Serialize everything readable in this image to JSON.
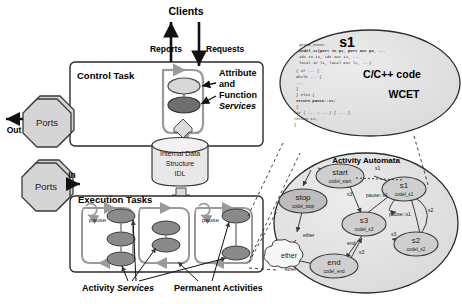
{
  "figure": {
    "colors": {
      "attribute_service": "#d2d2d2",
      "function_service": "#6f6f6f",
      "activity_service": "#8a8a8a",
      "box_stroke": "#2b2b2b",
      "ports_fill": "#d5d5d5",
      "cylinder_fill": "#e8e8e8",
      "ellipse_fill": "#e0e0e0",
      "node_fill": "#cfcfcf",
      "ether_fill": "#f5f5f5",
      "flow_arrow": "#9a9a9a"
    }
  },
  "left": {
    "clients_label": "Clients",
    "reports_label": "Reports",
    "requests_label": "Requests",
    "control_task_label": "Control Task",
    "execution_tasks_label": "Execution Tasks",
    "attribute_and_function_services": [
      "Attribute",
      "and",
      "Function",
      "Services"
    ],
    "idl_store": [
      "Internal Data",
      "Structure",
      "IDL"
    ],
    "ports": [
      {
        "name": "Ports",
        "direction": "Out"
      },
      {
        "name": "Ports",
        "direction": "In"
      }
    ],
    "pause_labels": [
      "pause",
      "pause",
      "pause"
    ],
    "bottom_labels": [
      {
        "text": "Activity ",
        "emph": "Services"
      },
      {
        "text": "Permanent Activities",
        "emph": ""
      }
    ]
  },
  "codel_ellipse": {
    "state_name": "s1",
    "lang_label": "C/C++ code",
    "wcet_label": "WCET",
    "code_lines": [
      "genom_event",
      "codel_s1(port in p1, port out p2, ...",
      "        ids in i1, ids out i2, ...",
      "        local in l1, local out l2, ...)",
      "{ if ... {",
      "      while ... {",
      "        ...",
      "      }",
      "  } else {",
      "      return pause::s1;",
      "  }",
      "  for ( ... ; ...) { ... }",
      "  return s2;",
      "}"
    ]
  },
  "automata": {
    "title": "Activity Automata",
    "nodes": [
      {
        "id": "start",
        "name": "start",
        "codel": "codel_start"
      },
      {
        "id": "stop",
        "name": "stop",
        "codel": "codel_stop"
      },
      {
        "id": "s1",
        "name": "s1",
        "codel": "codel_s1"
      },
      {
        "id": "s3",
        "name": "s3",
        "codel": "codel_s3"
      },
      {
        "id": "s2",
        "name": "s2",
        "codel": "codel_s2"
      },
      {
        "id": "end",
        "name": "end",
        "codel": "codel_end"
      }
    ],
    "ether_node": "ether",
    "edge_labels": [
      "s1",
      "s3",
      "pause::s1",
      "pause::s1",
      "s2",
      "s3",
      "end",
      "s3",
      "ether",
      "ether"
    ]
  }
}
